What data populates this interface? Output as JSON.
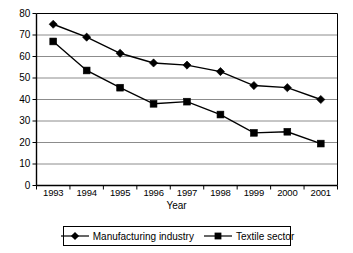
{
  "chart_data": {
    "type": "line",
    "title": "",
    "xlabel": "Year",
    "ylabel": "",
    "categories": [
      "1993",
      "1994",
      "1995",
      "1996",
      "1997",
      "1998",
      "1999",
      "2000",
      "2001"
    ],
    "x": [
      1993,
      1994,
      1995,
      1996,
      1997,
      1998,
      1999,
      2000,
      2001
    ],
    "ylim": [
      0,
      80
    ],
    "ytick_step": 10,
    "yticks": [
      80,
      70,
      60,
      50,
      40,
      30,
      20,
      10,
      0
    ],
    "grid": "horizontal",
    "legend_position": "bottom",
    "series": [
      {
        "name": "Manufacturing industry",
        "marker": "diamond",
        "color": "#000000",
        "values": [
          75,
          69,
          61.5,
          57,
          56,
          53,
          46.5,
          45.5,
          40
        ]
      },
      {
        "name": "Textile sector",
        "marker": "square",
        "color": "#000000",
        "values": [
          67,
          53.5,
          45.5,
          38,
          39,
          33,
          24.5,
          25,
          19.5
        ]
      }
    ]
  },
  "axis": {
    "x_title": "Year"
  },
  "legend": {
    "items": [
      {
        "label": "Manufacturing industry",
        "marker": "diamond"
      },
      {
        "label": "Textile sector",
        "marker": "square"
      }
    ]
  },
  "colors": {
    "line": "#000000",
    "grid": "#8c8c8c",
    "frame": "#000000",
    "background": "#ffffff"
  }
}
